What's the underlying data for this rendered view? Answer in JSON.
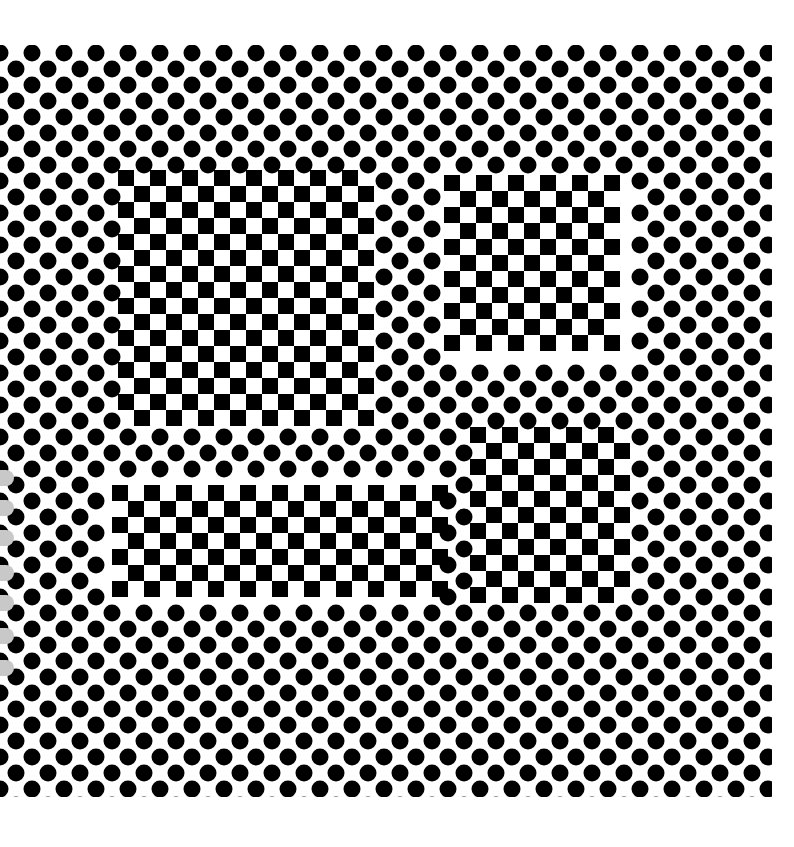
{
  "artwork": {
    "description": "Op-art pattern of black dots on a diagonal lattice with four embedded checkerboard regions",
    "colors": {
      "background": "#ffffff",
      "ink": "#000000",
      "shadow": "#c8c8c8"
    },
    "pattern_bounds": {
      "left": 0,
      "top": 45,
      "right": 772,
      "bottom": 797
    },
    "dots": {
      "origin_x": 32,
      "origin_y": 53,
      "step_x": 32,
      "step_y": 16,
      "row_offset_x": 16,
      "diameter": 17
    },
    "checker": {
      "cell": 16
    },
    "checker_regions": [
      {
        "name": "top-left",
        "x": 118,
        "y": 170,
        "w": 256,
        "h": 256,
        "skew": 0
      },
      {
        "name": "top-right",
        "x": 444,
        "y": 175,
        "w": 180,
        "h": 180,
        "skew": 0
      },
      {
        "name": "bottom-left",
        "x": 112,
        "y": 485,
        "w": 328,
        "h": 112,
        "skew": 0
      },
      {
        "name": "bottom-right",
        "x": 470,
        "y": 427,
        "w": 152,
        "h": 176,
        "skew": 0
      }
    ],
    "left_shadow_pills_y": [
      470,
      500,
      530,
      565,
      595,
      628,
      660
    ]
  }
}
